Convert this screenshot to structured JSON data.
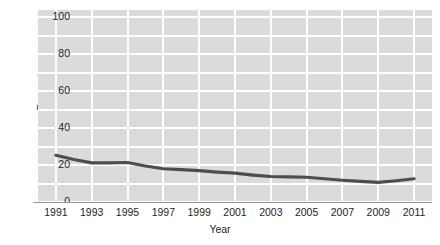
{
  "chart_data": {
    "type": "line",
    "title": "",
    "xlabel": "Year",
    "ylabel": "Percent",
    "x": [
      1991,
      1992,
      1993,
      1994,
      1995,
      1996,
      1997,
      1998,
      1999,
      2000,
      2001,
      2002,
      2003,
      2004,
      2005,
      2006,
      2007,
      2008,
      2009,
      2010,
      2011
    ],
    "series": [
      {
        "name": "Percent",
        "color": "#4d4d4d",
        "values": [
          25.3,
          23.0,
          21.2,
          21.2,
          21.4,
          19.5,
          18.0,
          17.5,
          17.0,
          16.2,
          15.6,
          14.6,
          13.8,
          13.6,
          13.4,
          12.6,
          11.8,
          11.2,
          10.6,
          11.5,
          12.6
        ]
      }
    ],
    "xtick_labels": [
      "1991",
      "1993",
      "1995",
      "1997",
      "1999",
      "2001",
      "2003",
      "2005",
      "2007",
      "2009",
      "2011"
    ],
    "xtick_values": [
      1991,
      1993,
      1995,
      1997,
      1999,
      2001,
      2003,
      2005,
      2007,
      2009,
      2011
    ],
    "ytick_labels": [
      "0",
      "20",
      "40",
      "60",
      "80",
      "100"
    ],
    "ytick_values": [
      0,
      20,
      40,
      60,
      80,
      100
    ],
    "xlim": [
      1990,
      2012
    ],
    "ylim": [
      0,
      104
    ],
    "grid": true,
    "grid_color": "#ffffff",
    "panel_color": "#dbdbdb",
    "legend": "none",
    "axis_color": "#939598",
    "text_color": "#231f20"
  }
}
